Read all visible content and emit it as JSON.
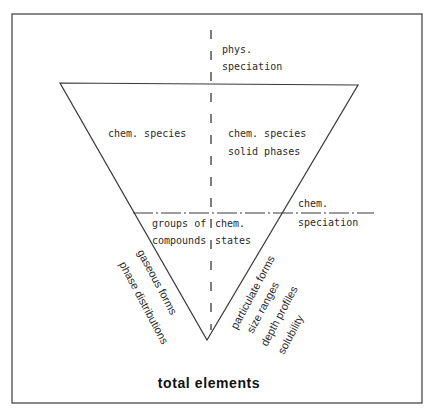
{
  "diagram": {
    "title": "total elements",
    "top_axis": {
      "line1": "phys.",
      "line2": "speciation"
    },
    "upper_left": {
      "line1": "chem. species"
    },
    "upper_right": {
      "line1": "chem. species",
      "line2": "solid phases"
    },
    "center_left": {
      "line1": "groups of",
      "line2": "compounds"
    },
    "center_right": {
      "line1": "chem.",
      "line2": "states"
    },
    "side_axis": {
      "line1": "chem.",
      "line2": "speciation"
    },
    "left_edge_labels": [
      "gaseous forms",
      "phase distributions"
    ],
    "right_edge_labels": [
      "particulate forms",
      "size ranges",
      "depth profiles",
      "solubility"
    ],
    "colors": {
      "line": "#3a3a3a",
      "text": "#2a2a2a",
      "background": "#ffffff"
    }
  }
}
